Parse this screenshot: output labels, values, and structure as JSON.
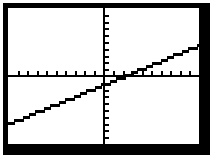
{
  "device": {
    "label": "graphing-calculator-display",
    "frame_color": "#000000",
    "screen_color": "#ffffff",
    "ink_color": "#000000"
  },
  "chart_data": {
    "type": "line",
    "title": "",
    "subtitle": "",
    "xlabel": "",
    "ylabel": "",
    "grid": false,
    "legend": false,
    "legend_position": "none",
    "tick_labels_shown": false,
    "axis_style": "crosshair-with-tick-marks",
    "xlim": [
      -10,
      10
    ],
    "ylim": [
      -10,
      10
    ],
    "x_tick_interval": 1,
    "y_tick_interval": 1,
    "x_tick_values": [
      -9,
      -8,
      -7,
      -6,
      -5,
      -4,
      -3,
      -2,
      -1,
      1,
      2,
      3,
      4,
      5,
      6,
      7,
      8,
      9
    ],
    "y_tick_values": [
      -9,
      -8,
      -7,
      -6,
      -5,
      -4,
      -3,
      -2,
      -1,
      1,
      2,
      3,
      4,
      5,
      6,
      7,
      8,
      9
    ],
    "series": [
      {
        "name": "Y1",
        "equation": "y = 0.58x - 1.5",
        "slope": 0.58,
        "intercept": -1.5,
        "x_intercept": 2.6,
        "y_intercept": -1.5,
        "x": [
          -10,
          -5,
          0,
          2.6,
          5,
          10
        ],
        "values": [
          -7.3,
          -4.4,
          -1.5,
          0,
          1.4,
          4.3
        ],
        "style": "solid",
        "color": "#000000"
      }
    ],
    "annotations": []
  },
  "axes": {
    "x_axis_name": "x-axis",
    "y_axis_name": "y-axis"
  }
}
